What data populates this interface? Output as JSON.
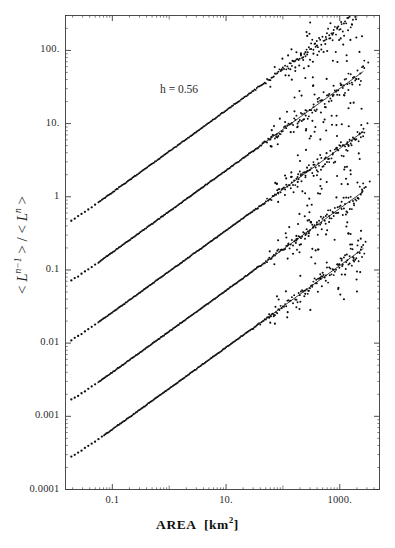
{
  "chart_data": {
    "type": "scatter",
    "title": "",
    "xlabel": "AREA [km2]",
    "xlabel_html": "AREA  [km<sup>2</sup>]",
    "ylabel": "< L^(n-1) > / < L^n >",
    "xscale": "log",
    "yscale": "log",
    "xlim": [
      0.015,
      5000
    ],
    "ylim": [
      0.0001,
      300
    ],
    "grid": false,
    "legend": false,
    "annotations": [
      {
        "text": "h = 0.56",
        "x_px": 160,
        "y_px": 83
      }
    ],
    "xticks": [
      {
        "label": "0.1",
        "value": 0.1
      },
      {
        "label": "10.",
        "value": 10
      },
      {
        "label": "1000.",
        "value": 1000
      }
    ],
    "yticks": [
      {
        "label": "100.",
        "value": 100
      },
      {
        "label": "10.",
        "value": 10
      },
      {
        "label": "1",
        "value": 1
      },
      {
        "label": "0.1",
        "value": 0.1
      },
      {
        "label": "0.01",
        "value": 0.01
      },
      {
        "label": "0.001",
        "value": 0.001
      },
      {
        "label": "0.0001",
        "value": 0.0001
      }
    ],
    "series": [
      {
        "name": "n = 1",
        "marker": "dot",
        "color": "#111111",
        "fit_slope": 0.56,
        "fit_intercept_log10": 0.62,
        "fit_x_range": [
          0.055,
          2600
        ],
        "plateau_value": 0.23,
        "knee_x": 0.07,
        "points": [
          [
            0.02,
            0.06
          ],
          [
            0.023,
            0.075
          ],
          [
            0.026,
            0.082
          ],
          [
            0.03,
            0.095
          ],
          [
            0.034,
            0.107
          ],
          [
            0.039,
            0.121
          ],
          [
            0.044,
            0.14
          ],
          [
            0.05,
            0.16
          ],
          [
            0.057,
            0.185
          ],
          [
            0.063,
            0.205
          ],
          [
            0.07,
            0.222
          ],
          [
            0.078,
            0.232
          ],
          [
            0.09,
            0.24
          ],
          [
            0.105,
            0.258
          ],
          [
            0.125,
            0.278
          ],
          [
            0.15,
            0.3
          ],
          [
            0.185,
            0.335
          ],
          [
            0.23,
            0.375
          ],
          [
            0.29,
            0.425
          ],
          [
            0.37,
            0.48
          ],
          [
            0.47,
            0.545
          ],
          [
            0.6,
            0.62
          ],
          [
            0.78,
            0.715
          ],
          [
            1.0,
            0.82
          ],
          [
            1.3,
            0.945
          ],
          [
            1.7,
            1.09
          ],
          [
            2.2,
            1.26
          ],
          [
            2.9,
            1.46
          ],
          [
            3.8,
            1.69
          ],
          [
            5.0,
            1.95
          ],
          [
            6.6,
            2.25
          ],
          [
            8.7,
            2.6
          ],
          [
            11.5,
            3.0
          ],
          [
            15.0,
            3.46
          ],
          [
            20.0,
            4.0
          ],
          [
            26.0,
            4.6
          ],
          [
            34.0,
            5.3
          ],
          [
            45.0,
            6.15
          ],
          [
            60.0,
            7.1
          ],
          [
            80.0,
            8.2
          ],
          [
            105.0,
            9.45
          ],
          [
            140.0,
            11.0
          ],
          [
            185.0,
            12.7
          ],
          [
            245.0,
            14.7
          ],
          [
            320.0,
            17.0
          ],
          [
            420.0,
            19.6
          ],
          [
            560.0,
            22.8
          ],
          [
            740.0,
            26.4
          ],
          [
            980.0,
            30.5
          ],
          [
            1300.0,
            35.3
          ],
          [
            1700.0,
            40.8
          ],
          [
            2200.0,
            47.0
          ],
          [
            2600.0,
            52.0
          ]
        ]
      },
      {
        "name": "n = 2",
        "marker": "dot",
        "color": "#111111",
        "fit_slope": 0.56,
        "fit_intercept_log10": -0.2,
        "fit_x_range": [
          0.055,
          2600
        ],
        "plateau_value": 0.038,
        "knee_x": 0.07
      },
      {
        "name": "n = 3",
        "marker": "dot",
        "color": "#111111",
        "fit_slope": 0.56,
        "fit_intercept_log10": -1.02,
        "fit_x_range": [
          0.055,
          2600
        ],
        "plateau_value": 0.0062,
        "knee_x": 0.07
      },
      {
        "name": "n = 4",
        "marker": "dot",
        "color": "#111111",
        "fit_slope": 0.56,
        "fit_intercept_log10": -1.84,
        "fit_x_range": [
          0.055,
          2600
        ],
        "plateau_value": 0.00105,
        "knee_x": 0.07
      },
      {
        "name": "n = 5",
        "marker": "dot",
        "color": "#111111",
        "fit_slope": 0.56,
        "fit_intercept_log10": -2.62,
        "fit_x_range": [
          0.07,
          2600
        ],
        "plateau_value": 0.00018,
        "knee_x": 0.09
      }
    ]
  },
  "caption": {
    "text": ""
  }
}
